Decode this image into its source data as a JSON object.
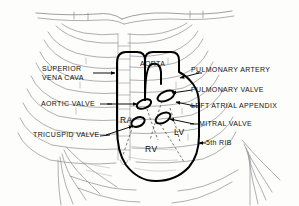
{
  "figure": {
    "background_color": "#fdfdfb",
    "outline_color": "#000000",
    "rib_color": "#8d8d92",
    "text_color": "#111111"
  },
  "labels": {
    "superior_vena_cava_line1": "SUPERIOR",
    "superior_vena_cava_line2": "VENA CAVA",
    "aortic_valve": "AORTIC  VALVE",
    "tricuspid_valve": "TRICUSPID VALVE",
    "aorta": "AORTA",
    "pulmonary_artery": "PULMONARY ARTERY",
    "pulmonary_valve": "PULMONARY VALVE",
    "left_atrial_appendix": "LEFT ATRIAL APPENDIX",
    "mitral_valve": "MITRAL  VALVE",
    "fifth_rib": "5th RIB"
  },
  "chambers": {
    "right_atrium": "RA",
    "left_ventricle": "LV",
    "right_ventricle": "RV"
  }
}
